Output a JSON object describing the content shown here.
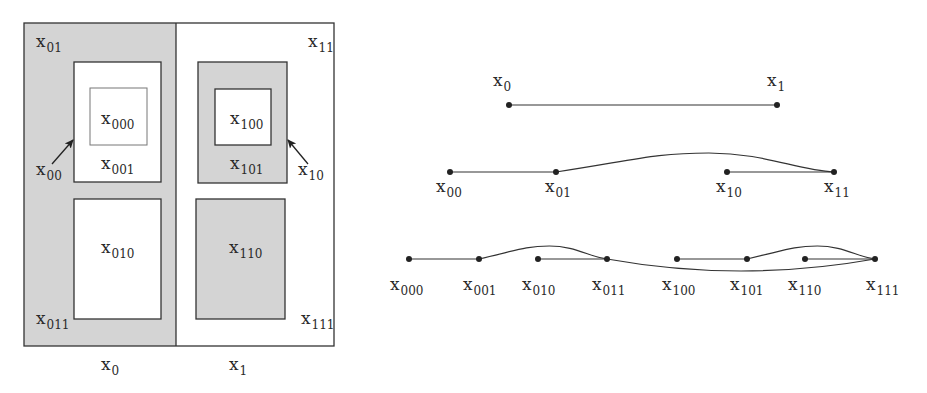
{
  "colors": {
    "gray_fill": "#d4d4d4",
    "white_fill": "#ffffff",
    "stroke": "#333333",
    "inner_stroke": "#777777"
  },
  "partition": {
    "outer": {
      "x": 24,
      "y": 23,
      "w": 310,
      "h": 323
    },
    "divider_x": 176,
    "regions": [
      {
        "id": "x0",
        "label": "x",
        "sub": "0",
        "fill": "gray"
      },
      {
        "id": "x1",
        "label": "x",
        "sub": "1",
        "fill": "white"
      }
    ],
    "boxes": [
      {
        "id": "x001",
        "x": 74,
        "y": 62,
        "w": 87,
        "h": 120,
        "fill": "white",
        "stroke": "dark"
      },
      {
        "id": "x000",
        "x": 90,
        "y": 88,
        "w": 57,
        "h": 57,
        "fill": "white",
        "stroke": "light"
      },
      {
        "id": "x010",
        "x": 74,
        "y": 199,
        "w": 87,
        "h": 120,
        "fill": "white",
        "stroke": "dark"
      },
      {
        "id": "x101",
        "x": 198,
        "y": 62,
        "w": 89,
        "h": 121,
        "fill": "gray",
        "stroke": "dark"
      },
      {
        "id": "x100",
        "x": 215,
        "y": 89,
        "w": 56,
        "h": 56,
        "fill": "white",
        "stroke": "dark"
      },
      {
        "id": "x110",
        "x": 196,
        "y": 199,
        "w": 89,
        "h": 120,
        "fill": "gray",
        "stroke": "dark"
      }
    ],
    "labels": [
      {
        "text": "x",
        "sub": "01",
        "x": 36,
        "y": 47
      },
      {
        "text": "x",
        "sub": "11",
        "x": 308,
        "y": 47
      },
      {
        "text": "x",
        "sub": "000",
        "x": 101,
        "y": 124
      },
      {
        "text": "x",
        "sub": "001",
        "x": 101,
        "y": 169
      },
      {
        "text": "x",
        "sub": "100",
        "x": 230,
        "y": 124
      },
      {
        "text": "x",
        "sub": "101",
        "x": 230,
        "y": 169
      },
      {
        "text": "x",
        "sub": "00",
        "x": 36,
        "y": 175
      },
      {
        "text": "x",
        "sub": "10",
        "x": 298,
        "y": 175
      },
      {
        "text": "x",
        "sub": "010",
        "x": 101,
        "y": 253
      },
      {
        "text": "x",
        "sub": "110",
        "x": 229,
        "y": 253
      },
      {
        "text": "x",
        "sub": "011",
        "x": 36,
        "y": 324
      },
      {
        "text": "x",
        "sub": "111",
        "x": 301,
        "y": 324
      },
      {
        "text": "x",
        "sub": "0",
        "x": 101,
        "y": 370
      },
      {
        "text": "x",
        "sub": "1",
        "x": 229,
        "y": 370
      }
    ],
    "arrows": [
      {
        "id": "arrow-x00",
        "from": [
          52,
          164
        ],
        "to": [
          73,
          140
        ]
      },
      {
        "id": "arrow-x10",
        "from": [
          308,
          164
        ],
        "to": [
          288,
          140
        ]
      }
    ]
  },
  "tree": {
    "levels": [
      {
        "y": 105,
        "nodes": [
          {
            "id": "x0",
            "text": "x",
            "sub": "0",
            "x": 509,
            "label_x": 493,
            "label_y": 86
          },
          {
            "id": "x1",
            "text": "x",
            "sub": "1",
            "x": 777,
            "label_x": 767,
            "label_y": 86
          }
        ],
        "edges": [
          {
            "type": "line",
            "from": "x0",
            "to": "x1"
          }
        ]
      },
      {
        "y": 172,
        "nodes": [
          {
            "id": "x00",
            "text": "x",
            "sub": "00",
            "x": 450,
            "label_x": 436,
            "label_y": 192
          },
          {
            "id": "x01",
            "text": "x",
            "sub": "01",
            "x": 556,
            "label_x": 545,
            "label_y": 192
          },
          {
            "id": "x10",
            "text": "x",
            "sub": "10",
            "x": 727,
            "label_x": 716,
            "label_y": 192
          },
          {
            "id": "x11",
            "text": "x",
            "sub": "11",
            "x": 834,
            "label_x": 824,
            "label_y": 192
          }
        ],
        "edges": [
          {
            "type": "line",
            "from": "x00",
            "to": "x01"
          },
          {
            "type": "curve-up",
            "from": "x01",
            "to": "x11",
            "peak_y": 153
          },
          {
            "type": "line",
            "from": "x10",
            "to": "x11"
          }
        ]
      },
      {
        "y": 259,
        "nodes": [
          {
            "id": "x000",
            "text": "x",
            "sub": "000",
            "x": 409,
            "label_x": 390,
            "label_y": 290
          },
          {
            "id": "x001",
            "text": "x",
            "sub": "001",
            "x": 479,
            "label_x": 463,
            "label_y": 290
          },
          {
            "id": "x010",
            "text": "x",
            "sub": "010",
            "x": 538,
            "label_x": 522,
            "label_y": 290
          },
          {
            "id": "x011",
            "text": "x",
            "sub": "011",
            "x": 607,
            "label_x": 592,
            "label_y": 290
          },
          {
            "id": "x100",
            "text": "x",
            "sub": "100",
            "x": 677,
            "label_x": 662,
            "label_y": 290
          },
          {
            "id": "x101",
            "text": "x",
            "sub": "101",
            "x": 747,
            "label_x": 730,
            "label_y": 290
          },
          {
            "id": "x110",
            "text": "x",
            "sub": "110",
            "x": 805,
            "label_x": 788,
            "label_y": 290
          },
          {
            "id": "x111",
            "text": "x",
            "sub": "111",
            "x": 875,
            "label_x": 866,
            "label_y": 290
          }
        ],
        "edges": [
          {
            "type": "line",
            "from": "x000",
            "to": "x001"
          },
          {
            "type": "curve-up",
            "from": "x001",
            "to": "x011",
            "peak_y": 246
          },
          {
            "type": "line",
            "from": "x010",
            "to": "x011"
          },
          {
            "type": "curve-down",
            "from": "x011",
            "to": "x111",
            "trough_y": 271
          },
          {
            "type": "line",
            "from": "x100",
            "to": "x101"
          },
          {
            "type": "curve-up",
            "from": "x101",
            "to": "x111",
            "peak_y": 246
          },
          {
            "type": "line",
            "from": "x110",
            "to": "x111"
          }
        ]
      }
    ]
  }
}
